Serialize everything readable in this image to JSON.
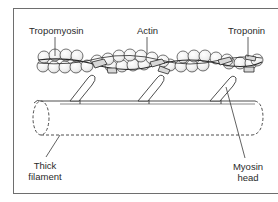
{
  "diagram": {
    "title": "",
    "labels": {
      "tropomyosin": "Tropomyosin",
      "actin": "Actin",
      "troponin": "Troponin",
      "thick_filament_line1": "Thick",
      "thick_filament_line2": "filament",
      "myosin_head_line1": "Myosin",
      "myosin_head_line2": "head"
    },
    "colors": {
      "stroke": "#3a3a3a",
      "bead_fill": "#f4f4f4",
      "frame": "#6e6e6e",
      "text": "#2a2a2a"
    }
  }
}
